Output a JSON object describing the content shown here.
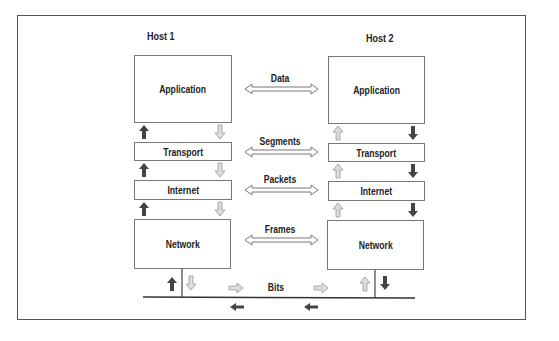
{
  "hosts": [
    {
      "title": "Host 1",
      "layers": [
        "Application",
        "Transport",
        "Internet",
        "Network"
      ]
    },
    {
      "title": "Host 2",
      "layers": [
        "Application",
        "Transport",
        "Internet",
        "Network"
      ]
    }
  ],
  "peer_units": [
    "Data",
    "Segments",
    "Packets",
    "Frames"
  ],
  "medium_label": "Bits",
  "colors": {
    "dark_arrow": "#444444",
    "light_arrow": "#aaaaaa",
    "border": "#555555"
  }
}
